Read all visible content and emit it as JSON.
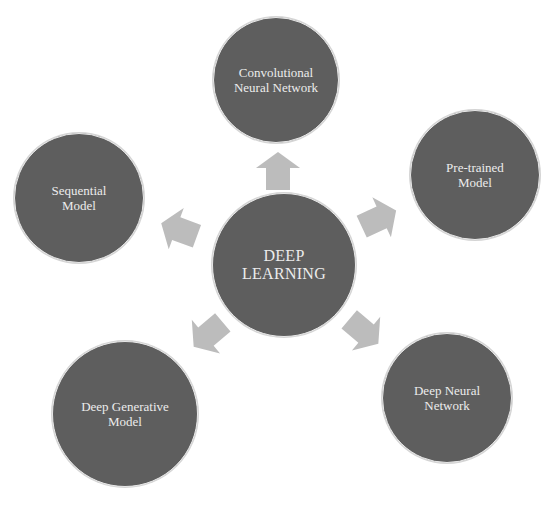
{
  "colors": {
    "node_fill": "#5e5e5e",
    "node_text": "#ececec",
    "arrow_fill": "#bcbcbc",
    "background": "#ffffff"
  },
  "center": {
    "label": "DEEP\nLEARNING",
    "cx": 284,
    "cy": 265,
    "r": 72
  },
  "nodes": [
    {
      "id": "cnn",
      "label": "Convolutional\nNeural Network",
      "cx": 276,
      "cy": 80,
      "r": 63
    },
    {
      "id": "pretrained",
      "label": "Pre-trained\nModel",
      "cx": 475,
      "cy": 175,
      "r": 65
    },
    {
      "id": "dnn",
      "label": "Deep Neural\nNetwork",
      "cx": 447,
      "cy": 398,
      "r": 65
    },
    {
      "id": "generative",
      "label": "Deep Generative\nModel",
      "cx": 125,
      "cy": 414,
      "r": 73
    },
    {
      "id": "sequential",
      "label": "Sequential\nModel",
      "cx": 79,
      "cy": 198,
      "r": 65
    }
  ],
  "arrows": [
    {
      "target": "cnn",
      "cx": 278,
      "cy": 172,
      "angle": -90
    },
    {
      "target": "pretrained",
      "cx": 378,
      "cy": 219,
      "angle": -25
    },
    {
      "target": "dnn",
      "cx": 363,
      "cy": 331,
      "angle": 40
    },
    {
      "target": "generative",
      "cx": 209,
      "cy": 334,
      "angle": 140
    },
    {
      "target": "sequential",
      "cx": 180,
      "cy": 230,
      "angle": 200
    }
  ]
}
